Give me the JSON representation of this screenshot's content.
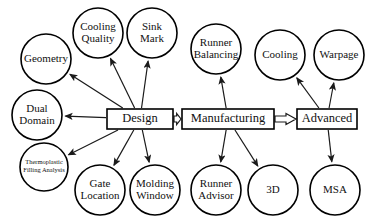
{
  "diagram": {
    "type": "flowchart",
    "title": "",
    "stages": [
      {
        "id": "design",
        "label": "Design",
        "shape": "rectangle",
        "x": 107,
        "y": 109,
        "w": 66,
        "h": 20
      },
      {
        "id": "manufacturing",
        "label": "Manufacturing",
        "shape": "rectangle",
        "x": 182,
        "y": 109,
        "w": 92,
        "h": 20
      },
      {
        "id": "advanced",
        "label": "Advanced",
        "shape": "rectangle",
        "x": 297,
        "y": 109,
        "w": 60,
        "h": 20
      }
    ],
    "nodes": [
      {
        "id": "geometry",
        "label": "Geometry",
        "lines": [
          "Geometry"
        ],
        "shape": "circle",
        "cx": 46,
        "cy": 59,
        "r": 25,
        "font": 11
      },
      {
        "id": "cooling-quality",
        "label": "Cooling Quality",
        "lines": [
          "Cooling",
          "Quality"
        ],
        "shape": "circle",
        "cx": 98,
        "cy": 33,
        "r": 25,
        "font": 11
      },
      {
        "id": "sink-mark",
        "label": "Sink Mark",
        "lines": [
          "Sink",
          "Mark"
        ],
        "shape": "circle",
        "cx": 152,
        "cy": 33,
        "r": 25,
        "font": 11
      },
      {
        "id": "runner-balancing",
        "label": "Runner Balancing",
        "lines": [
          "Runner",
          "Balancing"
        ],
        "shape": "circle",
        "cx": 216,
        "cy": 49,
        "r": 25,
        "font": 11
      },
      {
        "id": "cooling",
        "label": "Cooling",
        "lines": [
          "Cooling"
        ],
        "shape": "circle",
        "cx": 280,
        "cy": 55,
        "r": 25,
        "font": 11
      },
      {
        "id": "warpage",
        "label": "Warpage",
        "lines": [
          "Warpage"
        ],
        "shape": "circle",
        "cx": 339,
        "cy": 55,
        "r": 25,
        "font": 11
      },
      {
        "id": "dual-domain",
        "label": "Dual Domain",
        "lines": [
          "Dual",
          "Domain"
        ],
        "shape": "circle",
        "cx": 37,
        "cy": 115,
        "r": 25,
        "font": 11
      },
      {
        "id": "thermoplastic-filling-analysis",
        "label": "Thermoplastic Filling Analysis",
        "lines": [
          "Thermoplastic",
          "Filling Analysis"
        ],
        "shape": "circle",
        "cx": 44,
        "cy": 167,
        "r": 24,
        "font": 6.5
      },
      {
        "id": "gate-location",
        "label": "Gate Location",
        "lines": [
          "Gate",
          "Location"
        ],
        "shape": "circle",
        "cx": 100,
        "cy": 190,
        "r": 25,
        "font": 11
      },
      {
        "id": "molding-window",
        "label": "Molding Window",
        "lines": [
          "Molding",
          "Window"
        ],
        "shape": "circle",
        "cx": 155,
        "cy": 190,
        "r": 25,
        "font": 11
      },
      {
        "id": "runner-advisor",
        "label": "Runner Advisor",
        "lines": [
          "Runner",
          "Advisor"
        ],
        "shape": "circle",
        "cx": 216,
        "cy": 190,
        "r": 25,
        "font": 11
      },
      {
        "id": "3d",
        "label": "3D",
        "lines": [
          "3D"
        ],
        "shape": "circle",
        "cx": 273,
        "cy": 190,
        "r": 25,
        "font": 11
      },
      {
        "id": "msa",
        "label": "MSA",
        "lines": [
          "MSA"
        ],
        "shape": "circle",
        "cx": 335,
        "cy": 190,
        "r": 25,
        "font": 11
      }
    ],
    "edges": [
      {
        "id": "design-to-geometry",
        "from": "design",
        "to": "geometry",
        "style": "thin-arrow"
      },
      {
        "id": "design-to-cooling-quality",
        "from": "design",
        "to": "cooling-quality",
        "style": "thin-arrow"
      },
      {
        "id": "design-to-sink-mark",
        "from": "design",
        "to": "sink-mark",
        "style": "thin-arrow"
      },
      {
        "id": "design-to-dual-domain",
        "from": "design",
        "to": "dual-domain",
        "style": "thin-arrow"
      },
      {
        "id": "design-to-thermoplastic-filling-analysis",
        "from": "design",
        "to": "thermoplastic-filling-analysis",
        "style": "thin-arrow"
      },
      {
        "id": "design-to-gate-location",
        "from": "design",
        "to": "gate-location",
        "style": "thin-arrow"
      },
      {
        "id": "design-to-molding-window",
        "from": "design",
        "to": "molding-window",
        "style": "thin-arrow"
      },
      {
        "id": "manufacturing-to-runner-balancing",
        "from": "manufacturing",
        "to": "runner-balancing",
        "style": "thin-arrow"
      },
      {
        "id": "manufacturing-to-runner-advisor",
        "from": "manufacturing",
        "to": "runner-advisor",
        "style": "thin-arrow"
      },
      {
        "id": "manufacturing-to-3d",
        "from": "manufacturing",
        "to": "3d",
        "style": "thin-arrow"
      },
      {
        "id": "advanced-to-cooling",
        "from": "advanced",
        "to": "cooling",
        "style": "thin-arrow"
      },
      {
        "id": "advanced-to-warpage",
        "from": "advanced",
        "to": "warpage",
        "style": "thin-arrow"
      },
      {
        "id": "advanced-to-msa",
        "from": "advanced",
        "to": "msa",
        "style": "thin-arrow"
      },
      {
        "id": "design-to-manufacturing",
        "from": "design",
        "to": "manufacturing",
        "style": "block-arrow"
      },
      {
        "id": "manufacturing-to-advanced",
        "from": "manufacturing",
        "to": "advanced",
        "style": "block-arrow"
      }
    ],
    "colors": {
      "stroke": "#000000",
      "fill": "#ffffff",
      "text": "#111111"
    }
  }
}
